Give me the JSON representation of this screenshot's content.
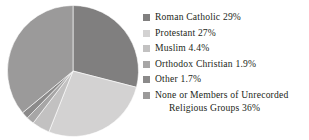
{
  "chart_data": {
    "type": "pie",
    "title": "",
    "subtitle": "",
    "xlabel": "",
    "ylabel": "",
    "legend_position": "right",
    "grid": false,
    "start_angle_deg": 0,
    "direction": "clockwise",
    "categories": [
      "Roman Catholic",
      "Protestant",
      "Muslim",
      "Orthodox Christian",
      "Other",
      "None or Members of Unrecorded Religious Groups"
    ],
    "values": [
      29,
      27,
      4.4,
      1.9,
      1.7,
      36
    ],
    "value_labels": [
      "29%",
      "27%",
      "4.4%",
      "1.9%",
      "1.7%",
      "36%"
    ],
    "colors": [
      "#807f7f",
      "#d3d2d2",
      "#c2c1c1",
      "#a7a6a6",
      "#8b8a8a",
      "#9b9a9a"
    ],
    "slices": [
      {
        "label": "Roman Catholic",
        "value": 29,
        "value_label": "29%",
        "color": "#807f7f"
      },
      {
        "label": "Protestant",
        "value": 27,
        "value_label": "27%",
        "color": "#d3d2d2"
      },
      {
        "label": "Muslim",
        "value": 4.4,
        "value_label": "4.4%",
        "color": "#c2c1c1"
      },
      {
        "label": "Orthodox Christian",
        "value": 1.9,
        "value_label": "1.9%",
        "color": "#a7a6a6"
      },
      {
        "label": "Other",
        "value": 1.7,
        "value_label": "1.7%",
        "color": "#8b8a8a"
      },
      {
        "label": "None or Members of Unrecorded Religious Groups",
        "value": 36,
        "value_label": "36%",
        "color": "#9b9a9a"
      }
    ]
  },
  "legend": {
    "items": [
      {
        "text": "Roman Catholic 29%",
        "swatch": "#807f7f",
        "swatch_name": "legend-swatch-roman-catholic"
      },
      {
        "text": "Protestant 27%",
        "swatch": "#d3d2d2",
        "swatch_name": "legend-swatch-protestant"
      },
      {
        "text": "Muslim 4.4%",
        "swatch": "#c2c1c1",
        "swatch_name": "legend-swatch-muslim"
      },
      {
        "text": "Orthodox Christian 1.9%",
        "swatch": "#a7a6a6",
        "swatch_name": "legend-swatch-orthodox-christian"
      },
      {
        "text": "Other 1.7%",
        "swatch": "#8b8a8a",
        "swatch_name": "legend-swatch-other"
      },
      {
        "text": "None or Members of Unrecorded",
        "text_line2": "Religious Groups 36%",
        "swatch": "#9b9a9a",
        "swatch_name": "legend-swatch-none-unrecorded"
      }
    ]
  }
}
